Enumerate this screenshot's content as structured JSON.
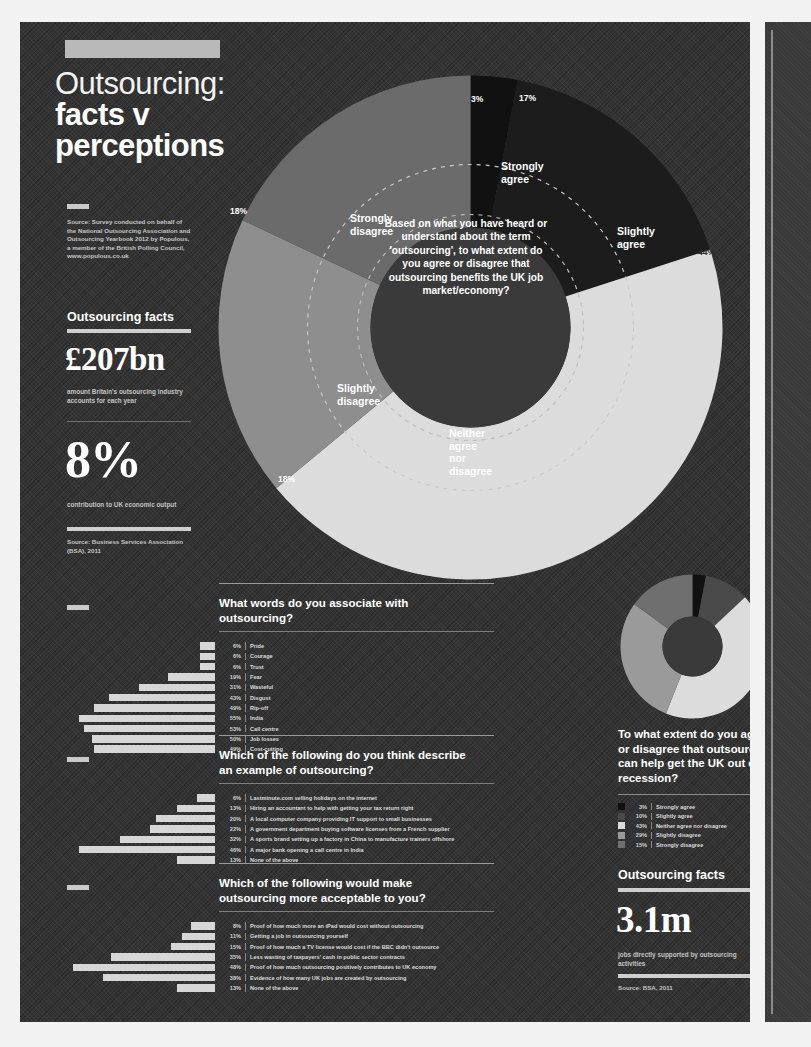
{
  "poster": {
    "title_line1": "Outsourcing:",
    "title_line2": "facts v",
    "title_line3": "perceptions",
    "source_note": "Source: Survey conducted on behalf of the National Outsourcing Association and Outsourcing Yearbook 2012 by Populous, a member of the British Polling Council, www.populous.co.uk"
  },
  "facts_left": {
    "heading": "Outsourcing facts",
    "stat1_value": "£207bn",
    "stat1_caption": "amount Britain's outsourcing industry accounts for each year",
    "stat2_value": "8%",
    "stat2_caption": "contribution to UK economic output",
    "source": "Source: Business Services Association (BSA), 2011"
  },
  "facts_right": {
    "heading": "Outsourcing facts",
    "stat_value": "3.1m",
    "stat_caption": "jobs directly supported by outsourcing activities",
    "source": "Source: BSA, 2011"
  },
  "chart_data": [
    {
      "type": "pie",
      "name": "main-donut",
      "title": "Based on what you have heard or understand about the term 'outsourcing', to what extent do you agree or disagree that outsourcing benefits the UK job market/economy?",
      "categories": [
        "Strongly agree",
        "Slightly agree",
        "Neither agree nor disagree",
        "Slightly disagree",
        "Strongly disagree"
      ],
      "values": [
        3,
        17,
        44,
        18,
        18
      ],
      "labels": [
        "3%",
        "17%",
        "44%",
        "18%",
        "18%"
      ],
      "colors": [
        "#111111",
        "#1c1c1c",
        "#dcdcdc",
        "#8e8e8e",
        "#6b6b6b"
      ],
      "legend": "on-chart"
    },
    {
      "type": "bar",
      "name": "words-associated",
      "title": "What words do you associate with outsourcing?",
      "categories": [
        "Pride",
        "Courage",
        "Trust",
        "Fear",
        "Wasteful",
        "Disgust",
        "Rip-off",
        "India",
        "Call centre",
        "Job losses",
        "Cost-cutting"
      ],
      "values": [
        6,
        6,
        6,
        19,
        31,
        43,
        49,
        55,
        53,
        50,
        49
      ],
      "labels": [
        "6%",
        "6%",
        "6%",
        "19%",
        "31%",
        "43%",
        "49%",
        "55%",
        "53%",
        "50%",
        "49%"
      ],
      "xlabel": "",
      "ylabel": "",
      "xlim": [
        0,
        60
      ],
      "grid": false
    },
    {
      "type": "bar",
      "name": "examples-of-outsourcing",
      "title": "Which of the following do you think describe an example of outsourcing?",
      "categories": [
        "Lastminute.com selling holidays on the internet",
        "Hiring an accountant to help with getting your tax return right",
        "A local computer company providing IT support to small businesses",
        "A government department buying software licenses from a French supplier",
        "A sports brand setting up a factory in China to manufacture trainers offshore",
        "A major bank opening a call centre in India",
        "None of the above"
      ],
      "values": [
        6,
        13,
        20,
        22,
        32,
        46,
        13
      ],
      "labels": [
        "6%",
        "13%",
        "20%",
        "22%",
        "32%",
        "46%",
        "13%"
      ],
      "xlim": [
        0,
        50
      ],
      "grid": false
    },
    {
      "type": "bar",
      "name": "more-acceptable",
      "title": "Which of the following would make outsourcing more acceptable to you?",
      "categories": [
        "Proof of how much more an iPad would cost without outsourcing",
        "Getting a job in outsourcing yourself",
        "Proof of how much a TV license would cost if the BBC didn't outsource",
        "Less wasting of taxpayers' cash in public sector contracts",
        "Proof of how much outsourcing positively contributes to UK economy",
        "Evidence of how many UK jobs are created by outsourcing",
        "None of the above"
      ],
      "values": [
        8,
        11,
        15,
        35,
        48,
        38,
        13
      ],
      "labels": [
        "8%",
        "11%",
        "15%",
        "35%",
        "48%",
        "38%",
        "13%"
      ],
      "xlim": [
        0,
        50
      ],
      "grid": false
    },
    {
      "type": "pie",
      "name": "recession-donut",
      "title": "To what extent do you agree or disagree that outsourcing can help get the UK out of recession?",
      "categories": [
        "Strongly agree",
        "Slightly agree",
        "Neither agree nor disagree",
        "Slightly disagree",
        "Strongly disagree"
      ],
      "values": [
        3,
        10,
        43,
        29,
        15
      ],
      "labels": [
        "3%",
        "10%",
        "43%",
        "29%",
        "15%"
      ],
      "colors": [
        "#111111",
        "#4a4a4a",
        "#dcdcdc",
        "#9a9a9a",
        "#6f6f6f"
      ],
      "legend": "below"
    }
  ],
  "sections": {
    "words": {
      "title": "What words do you associate with outsourcing?"
    },
    "examples": {
      "title": "Which of the following do you think describe an example of outsourcing?"
    },
    "acceptable": {
      "title": "Which of the following would make outsourcing more acceptable to you?"
    },
    "recession": {
      "question": "To what extent do you agree or disagree that outsourcing can help get the UK out of recession?"
    }
  },
  "donut_labels": {
    "strongly_agree": "Strongly\nagree",
    "slightly_agree": "Slightly\nagree",
    "neither": "Neither\nagree nor\ndisagree",
    "slightly_disagree": "Slightly\ndisagree",
    "strongly_disagree": "Strongly\ndisagree"
  }
}
